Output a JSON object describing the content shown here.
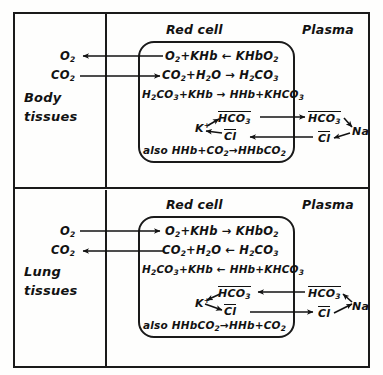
{
  "diagram": {
    "column_headers": {
      "red_cell": "Red cell",
      "plasma": "Plasma"
    },
    "panels": [
      {
        "id": "body",
        "tissue_label_line1": "Body",
        "tissue_label_line2": "tissues",
        "gas_labels": {
          "o2": "O",
          "o2_sub": "2",
          "co2": "CO",
          "co2_sub": "2"
        },
        "gas_arrow_directions": {
          "o2": "left",
          "co2": "right"
        },
        "equations": [
          {
            "id": "oxygen-release",
            "left": "O2 + KHb",
            "arrow": "left",
            "right": "KHbO2",
            "parts": [
              "O",
              "2",
              " + KHb",
              "KHbO",
              "2"
            ]
          },
          {
            "id": "carbonic-formation",
            "left": "CO2 + H2O",
            "arrow": "right",
            "right": "H2CO3",
            "parts": [
              "CO",
              "2",
              " + H",
              "2",
              "O",
              "H",
              "2",
              "CO",
              "3"
            ]
          },
          {
            "id": "buffering",
            "left": "H2CO3 + KHb",
            "arrow": "right",
            "right": "HHb + KHCO3",
            "parts": [
              "H",
              "2",
              "CO",
              "3",
              " + KHb",
              "HHb + KHCO",
              "3"
            ]
          },
          {
            "id": "carbamino",
            "text": "also HHb + CO2 → HHbCO2",
            "prefix": "also ",
            "left": "HHb + CO2",
            "arrow": "right",
            "right": "HHbCO2"
          }
        ],
        "ion_exchange": {
          "k": "K",
          "k_charge": "+",
          "hco3_cell": "HCO",
          "hco3_cell_sub": "3",
          "hco3_cell_charge": "-",
          "cl_cell": "Cl",
          "cl_cell_charge": "-",
          "hco3_plasma": "HCO",
          "hco3_plasma_sub": "3",
          "hco3_plasma_charge": "-",
          "cl_plasma": "Cl",
          "cl_plasma_charge": "-",
          "na": "Na",
          "hco3_transport_direction": "to-plasma",
          "cl_transport_direction": "to-cell"
        }
      },
      {
        "id": "lung",
        "tissue_label_line1": "Lung",
        "tissue_label_line2": "tissues",
        "gas_labels": {
          "o2": "O",
          "o2_sub": "2",
          "co2": "CO",
          "co2_sub": "2"
        },
        "gas_arrow_directions": {
          "o2": "right",
          "co2": "left"
        },
        "equations": [
          {
            "id": "oxygen-uptake",
            "left": "O2 + KHb",
            "arrow": "right",
            "right": "KHbO2"
          },
          {
            "id": "carbonic-breakdown",
            "left": "CO2 + H2O",
            "arrow": "left",
            "right": "H2CO3"
          },
          {
            "id": "debuffering",
            "left": "H2CO3 + KHb",
            "arrow": "left",
            "right": "HHb + KHCO3"
          },
          {
            "id": "carbamino-release",
            "prefix": "also ",
            "left": "HHbCO2",
            "arrow": "right",
            "right": "HHb + CO2"
          }
        ],
        "ion_exchange": {
          "k": "K",
          "k_charge": "+",
          "hco3_cell": "HCO",
          "hco3_cell_sub": "3",
          "hco3_cell_charge": "-",
          "cl_cell": "Cl",
          "cl_cell_charge": "-",
          "hco3_plasma": "HCO",
          "hco3_plasma_sub": "3",
          "hco3_plasma_charge": "-",
          "cl_plasma": "Cl",
          "cl_plasma_charge": "-",
          "na": "Na",
          "hco3_transport_direction": "to-cell",
          "cl_transport_direction": "to-plasma"
        }
      }
    ],
    "colors": {
      "ink": "#121212",
      "paper": "#fefefd"
    }
  }
}
